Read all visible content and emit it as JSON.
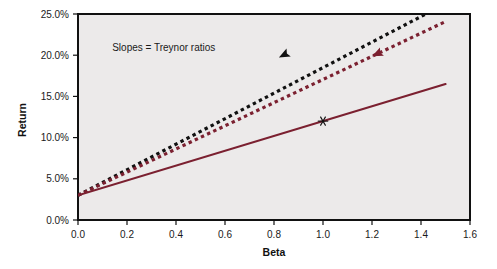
{
  "chart_data": {
    "type": "line",
    "title": "",
    "xlabel": "Beta",
    "ylabel": "Return",
    "xlim": [
      0.0,
      1.6
    ],
    "ylim": [
      0.0,
      0.25
    ],
    "xticks": [
      "0.0",
      "0.2",
      "0.4",
      "0.6",
      "0.8",
      "1.0",
      "1.2",
      "1.4",
      "1.6"
    ],
    "xtick_values": [
      0.0,
      0.2,
      0.4,
      0.6,
      0.8,
      1.0,
      1.2,
      1.4,
      1.6
    ],
    "yticks": [
      "0.0%",
      "5.0%",
      "10.0%",
      "15.0%",
      "20.0%",
      "25.0%"
    ],
    "ytick_values": [
      0.0,
      0.05,
      0.1,
      0.15,
      0.2,
      0.25
    ],
    "grid": false,
    "legend": "none",
    "plot_background": "#eceaea",
    "figure_background": "#ffffff",
    "annotations": [
      {
        "name": "slopes-note",
        "text": "Slopes = Treynor ratios",
        "x": 0.35,
        "y": 0.205
      }
    ],
    "series": [
      {
        "name": "steep-dotted-line",
        "style": "dotted",
        "color": "#111111",
        "intercept": 0.03,
        "slope": 0.155,
        "x": [
          0.0,
          1.42
        ],
        "y": [
          0.03,
          0.25
        ],
        "marker": {
          "type": "arrowhead-left",
          "x": 0.82,
          "y": 0.1971
        }
      },
      {
        "name": "middle-dotted-line",
        "style": "dotted",
        "color": "#7b2030",
        "intercept": 0.03,
        "slope": 0.1405,
        "x": [
          0.0,
          1.5
        ],
        "y": [
          0.03,
          0.2408
        ],
        "marker": {
          "type": "arrowhead-left",
          "x": 1.2,
          "y": 0.1986
        }
      },
      {
        "name": "security-market-line",
        "style": "solid",
        "color": "#7b2030",
        "intercept": 0.03,
        "slope": 0.09,
        "x": [
          0.0,
          1.5
        ],
        "y": [
          0.03,
          0.165
        ],
        "marker": {
          "type": "asterisk",
          "x": 1.0,
          "y": 0.12
        }
      }
    ]
  },
  "axes": {
    "x_title": "Beta",
    "y_title": "Return"
  }
}
